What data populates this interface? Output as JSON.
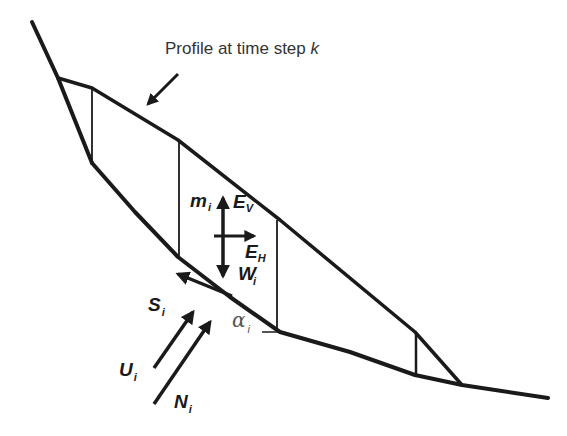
{
  "diagram": {
    "title_label": "Profile at time step ",
    "title_label_var": "k",
    "colors": {
      "line": "#1a1a1a",
      "text": "#1a1a1a",
      "annotation_text": "#333333",
      "angle_text": "#555555",
      "background": "#ffffff"
    },
    "forces": {
      "m": {
        "symbol": "m",
        "subscript": "i"
      },
      "Ev": {
        "symbol": "E",
        "subscript": "V"
      },
      "Eh": {
        "symbol": "E",
        "subscript": "H"
      },
      "W": {
        "symbol": "W",
        "subscript": "i"
      },
      "S": {
        "symbol": "S",
        "subscript": "i"
      },
      "U": {
        "symbol": "U",
        "subscript": "i"
      },
      "N": {
        "symbol": "N",
        "subscript": "i"
      },
      "alpha": {
        "symbol": "α",
        "subscript": "i"
      }
    },
    "elements": [
      "ground-slope-line",
      "failure-surface",
      "profile-top-line",
      "slice-boundaries",
      "profile-pointer-arrow",
      "force-arrows"
    ]
  }
}
